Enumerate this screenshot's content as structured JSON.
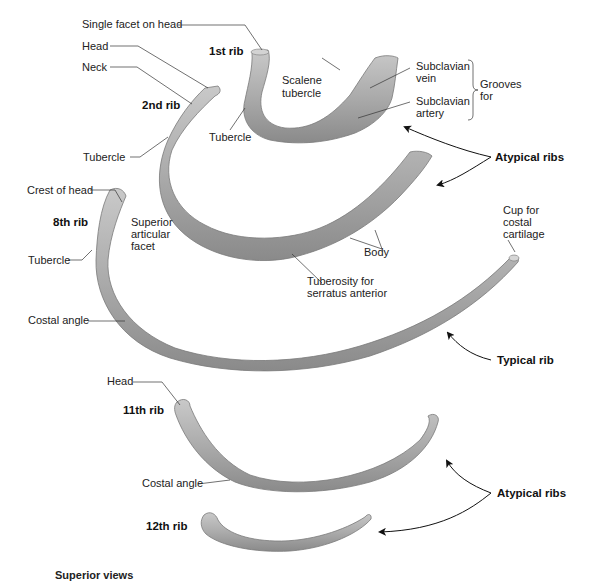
{
  "figure": {
    "caption": "Superior views",
    "colors": {
      "bone": "#a9a9a9",
      "bone_dark": "#7d7d7d",
      "bone_light": "#cfcfcf",
      "line": "#333333",
      "background": "#ffffff"
    }
  },
  "ribs": {
    "first": {
      "name": "1st rib",
      "labels": {
        "single_facet": "Single facet on head",
        "tubercle": "Tubercle",
        "scalene_tubercle_1": "Scalene",
        "scalene_tubercle_2": "tubercle",
        "subclavian_vein_1": "Subclavian",
        "subclavian_vein_2": "vein",
        "subclavian_artery_1": "Subclavian",
        "subclavian_artery_2": "artery",
        "grooves_for_1": "Grooves",
        "grooves_for_2": "for"
      }
    },
    "second": {
      "name": "2nd rib",
      "labels": {
        "head": "Head",
        "neck": "Neck",
        "tubercle": "Tubercle",
        "body": "Body",
        "tuberosity_1": "Tuberosity for",
        "tuberosity_2": "serratus anterior"
      }
    },
    "eighth": {
      "name": "8th rib",
      "labels": {
        "crest_of_head": "Crest of head",
        "superior_facet_1": "Superior",
        "superior_facet_2": "articular",
        "superior_facet_3": "facet",
        "tubercle": "Tubercle",
        "costal_angle": "Costal angle",
        "cup_1": "Cup for",
        "cup_2": "costal",
        "cup_3": "cartilage"
      }
    },
    "eleventh": {
      "name": "11th rib",
      "labels": {
        "head": "Head",
        "costal_angle": "Costal angle"
      }
    },
    "twelfth": {
      "name": "12th rib"
    }
  },
  "groups": {
    "atypical_upper": "Atypical ribs",
    "typical": "Typical rib",
    "atypical_lower": "Atypical ribs"
  }
}
